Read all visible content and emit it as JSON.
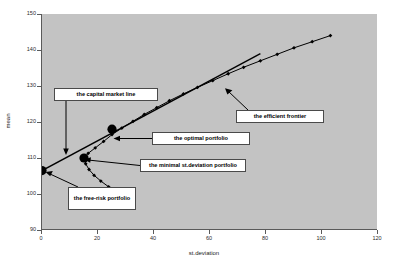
{
  "chart": {
    "title": "",
    "xlabel": "st.deviation",
    "ylabel": "mean",
    "plot_bg_color": "#c3c3c3",
    "page_bg_color": "#ffffff",
    "series_color": "#000000"
  },
  "axes": {
    "x_ticks": [
      "0",
      "20",
      "40",
      "60",
      "80",
      "100",
      "120"
    ],
    "y_ticks": [
      "90",
      "100",
      "110",
      "120",
      "130",
      "140",
      "150"
    ]
  },
  "annotations": {
    "capital_market_line": "the capital market line",
    "optimal_portfolio": "the optimal portfolio",
    "minimal_st_deviation_portfolio": "the minimal  st.deviation portfolio",
    "free_risk_portfolio": "the free-risk portfolio",
    "efficient_frontier": "the efficient frontier"
  },
  "chart_data": {
    "type": "scatter",
    "title": "",
    "xlabel": "st.deviation",
    "ylabel": "mean",
    "xlim": [
      0,
      120
    ],
    "ylim": [
      90,
      150
    ],
    "grid": false,
    "legend": null,
    "series": [
      {
        "name": "efficient frontier (upper branch)",
        "marker": "filled-diamond",
        "line": true,
        "x": [
          15.0,
          16.5,
          19.0,
          22.0,
          25.0,
          28.5,
          32.5,
          36.5,
          41.0,
          45.5,
          50.5,
          55.5,
          61.0,
          66.5,
          72.0,
          78.0,
          84.0,
          90.0,
          96.5,
          103.0
        ],
        "y": [
          110.0,
          111.3,
          112.8,
          114.6,
          116.5,
          118.3,
          120.2,
          122.1,
          124.0,
          125.9,
          127.8,
          129.6,
          131.5,
          133.4,
          135.2,
          137.0,
          138.8,
          140.6,
          142.3,
          144.0
        ]
      },
      {
        "name": "inefficient frontier (lower branch)",
        "marker": "filled-diamond",
        "line": true,
        "x": [
          15.0,
          15.6,
          16.8,
          18.6,
          21.0,
          23.8,
          27.0,
          29.0
        ],
        "y": [
          110.0,
          108.4,
          106.8,
          105.2,
          103.6,
          102.0,
          100.5,
          99.6
        ]
      },
      {
        "name": "the capital market line",
        "marker": "none",
        "line": true,
        "x": [
          0.0,
          78.0
        ],
        "y": [
          106.5,
          139.0
        ]
      }
    ],
    "points": [
      {
        "name": "the free-risk portfolio",
        "x": 0.0,
        "y": 106.5,
        "marker": "large-filled-circle"
      },
      {
        "name": "the minimal  st.deviation portfolio",
        "x": 15.0,
        "y": 110.0,
        "marker": "large-filled-circle"
      },
      {
        "name": "the optimal portfolio",
        "x": 25.0,
        "y": 118.0,
        "marker": "large-filled-circle"
      }
    ]
  }
}
